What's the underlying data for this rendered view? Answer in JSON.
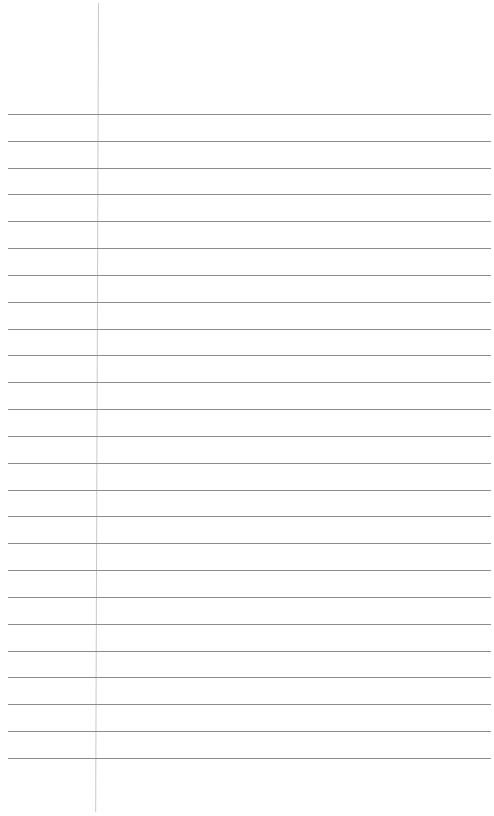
{
  "page": {
    "type": "blank ruled notebook paper",
    "background_color": "#ffffff",
    "rule_color": "#8c8c8c",
    "margin_color": "#c9c9c9",
    "rule_count": 25,
    "first_rule_y": 114,
    "rule_spacing": 26.83,
    "margin_x": 98
  }
}
